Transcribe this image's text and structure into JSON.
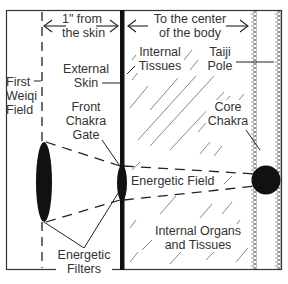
{
  "diagram": {
    "colors": {
      "line": "#222222",
      "text": "#333333",
      "fill": "#111111",
      "background": "#ffffff",
      "chain": "#777777"
    },
    "top_labels": {
      "skin_distance_line1": "1\" from",
      "skin_distance_line2": "the skin",
      "center_line1": "To the center",
      "center_line2": "of the body"
    },
    "labels": {
      "first_weiqi_1": "First",
      "first_weiqi_2": "Weiqi",
      "first_weiqi_3": "Field",
      "external_skin_1": "External",
      "external_skin_2": "Skin",
      "front_chakra_1": "Front",
      "front_chakra_2": "Chakra",
      "front_chakra_3": "Gate",
      "internal_tissues_1": "Internal",
      "internal_tissues_2": "Tissues",
      "taiji_pole_1": "Taiji",
      "taiji_pole_2": "Pole",
      "core_chakra_1": "Core",
      "core_chakra_2": "Chakra",
      "energetic_field": "Energetic Field",
      "energetic_filters_1": "Energetic",
      "energetic_filters_2": "Filters",
      "internal_organs_1": "Internal Organs",
      "internal_organs_2": "and Tissues"
    }
  }
}
